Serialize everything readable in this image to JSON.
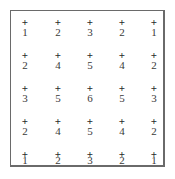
{
  "grid": {
    "marker": "+",
    "rows": [
      [
        1,
        2,
        3,
        2,
        1
      ],
      [
        2,
        4,
        5,
        4,
        2
      ],
      [
        3,
        5,
        6,
        5,
        3
      ],
      [
        2,
        4,
        5,
        4,
        2
      ],
      [
        1,
        2,
        3,
        2,
        1
      ]
    ]
  }
}
